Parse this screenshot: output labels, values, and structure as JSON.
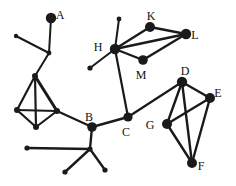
{
  "figure": {
    "background_color": "#ffffff",
    "stroke_color": "#1a1a1a",
    "label_color": "#111111",
    "width": 236,
    "height": 186
  },
  "chart_data": {
    "type": "diagram",
    "subtype": "node-link-graph",
    "title": "",
    "xlabel": "",
    "ylabel": "",
    "grid": false,
    "legend": null,
    "xlim": [
      0,
      236
    ],
    "ylim": [
      0,
      186
    ],
    "labeled_nodes": [
      {
        "id": "A",
        "label": "A",
        "x": 51,
        "y": 18,
        "r": 5.2,
        "label_dx": 9,
        "label_dy": -2
      },
      {
        "id": "B",
        "label": "B",
        "x": 92,
        "y": 127,
        "r": 4.8,
        "label_dx": -3,
        "label_dy": -9
      },
      {
        "id": "C",
        "label": "C",
        "x": 128,
        "y": 117,
        "r": 4.6,
        "label_dx": -2,
        "label_dy": 16
      },
      {
        "id": "D",
        "label": "D",
        "x": 182,
        "y": 82,
        "r": 5.2,
        "label_dx": 3,
        "label_dy": -10
      },
      {
        "id": "E",
        "label": "E",
        "x": 210,
        "y": 98,
        "r": 5.0,
        "label_dx": 8,
        "label_dy": -4
      },
      {
        "id": "F",
        "label": "F",
        "x": 192,
        "y": 163,
        "r": 5.0,
        "label_dx": 9,
        "label_dy": 4
      },
      {
        "id": "G",
        "label": "G",
        "x": 167,
        "y": 124,
        "r": 5.0,
        "label_dx": -17,
        "label_dy": 2
      },
      {
        "id": "H",
        "label": "H",
        "x": 115,
        "y": 49,
        "r": 5.2,
        "label_dx": -17,
        "label_dy": -1
      },
      {
        "id": "K",
        "label": "K",
        "x": 150,
        "y": 27,
        "r": 5.0,
        "label_dx": 1,
        "label_dy": -10
      },
      {
        "id": "L",
        "label": "L",
        "x": 186,
        "y": 34,
        "r": 5.2,
        "label_dx": 9,
        "label_dy": 2
      },
      {
        "id": "M",
        "label": "M",
        "x": 143,
        "y": 60,
        "r": 4.8,
        "label_dx": -2,
        "label_dy": 16
      }
    ],
    "unlabeled_nodes": [
      {
        "id": "n1",
        "x": 49,
        "y": 53,
        "r": 2.4
      },
      {
        "id": "n2",
        "x": 16,
        "y": 36,
        "r": 2.2
      },
      {
        "id": "n3",
        "x": 35,
        "y": 76,
        "r": 3.0
      },
      {
        "id": "n4",
        "x": 17,
        "y": 110,
        "r": 3.0
      },
      {
        "id": "n5",
        "x": 36,
        "y": 127,
        "r": 3.0
      },
      {
        "id": "n6",
        "x": 57,
        "y": 111,
        "r": 3.0
      },
      {
        "id": "n7",
        "x": 90,
        "y": 149,
        "r": 2.6
      },
      {
        "id": "n8",
        "x": 27,
        "y": 148,
        "r": 2.6
      },
      {
        "id": "n9",
        "x": 65,
        "y": 172,
        "r": 2.6
      },
      {
        "id": "n10",
        "x": 105,
        "y": 170,
        "r": 2.6
      },
      {
        "id": "n11",
        "x": 119,
        "y": 19,
        "r": 2.4
      },
      {
        "id": "n12",
        "x": 90,
        "y": 68,
        "r": 2.6
      }
    ],
    "edges": [
      {
        "from": "A",
        "to": "n1",
        "width": 2.0
      },
      {
        "from": "n1",
        "to": "n2",
        "width": 2.0
      },
      {
        "from": "n1",
        "to": "n3",
        "width": 2.0
      },
      {
        "from": "n3",
        "to": "n4",
        "width": 2.2
      },
      {
        "from": "n3",
        "to": "n5",
        "width": 2.2
      },
      {
        "from": "n3",
        "to": "n6",
        "width": 3.0
      },
      {
        "from": "n4",
        "to": "n5",
        "width": 2.2
      },
      {
        "from": "n4",
        "to": "n6",
        "width": 2.2
      },
      {
        "from": "n5",
        "to": "n6",
        "width": 2.2
      },
      {
        "from": "n6",
        "to": "B",
        "width": 2.2
      },
      {
        "from": "B",
        "to": "C",
        "width": 2.4
      },
      {
        "from": "B",
        "to": "n7",
        "width": 2.4
      },
      {
        "from": "n7",
        "to": "n8",
        "width": 2.4
      },
      {
        "from": "n7",
        "to": "n9",
        "width": 2.4
      },
      {
        "from": "n7",
        "to": "n10",
        "width": 2.4
      },
      {
        "from": "C",
        "to": "H",
        "width": 2.2
      },
      {
        "from": "C",
        "to": "D",
        "width": 2.2
      },
      {
        "from": "H",
        "to": "n11",
        "width": 2.0
      },
      {
        "from": "H",
        "to": "n12",
        "width": 2.0
      },
      {
        "from": "H",
        "to": "K",
        "width": 2.4
      },
      {
        "from": "H",
        "to": "L",
        "width": 2.4
      },
      {
        "from": "H",
        "to": "M",
        "width": 2.4
      },
      {
        "from": "K",
        "to": "L",
        "width": 2.4
      },
      {
        "from": "M",
        "to": "L",
        "width": 2.4
      },
      {
        "from": "D",
        "to": "E",
        "width": 2.4
      },
      {
        "from": "D",
        "to": "G",
        "width": 2.4
      },
      {
        "from": "D",
        "to": "F",
        "width": 2.4
      },
      {
        "from": "E",
        "to": "G",
        "width": 2.4
      },
      {
        "from": "E",
        "to": "F",
        "width": 2.4
      },
      {
        "from": "G",
        "to": "F",
        "width": 2.4
      }
    ]
  }
}
